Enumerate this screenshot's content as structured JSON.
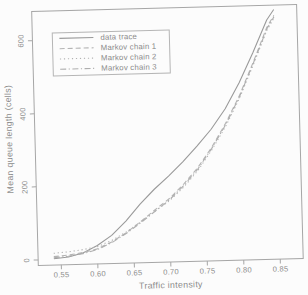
{
  "figure": {
    "background": "#fcfcfc",
    "axis_color": "#a6a6a6",
    "text_color": "#8c8c8c",
    "legend_border_color": "#b5b5b5"
  },
  "chart_data": {
    "type": "line",
    "title": "",
    "xlabel": "Traffic intensity",
    "ylabel": "Mean queue length (cells)",
    "xlim": [
      0.5185,
      0.8815
    ],
    "ylim": [
      -15,
      680
    ],
    "xticks": [
      0.55,
      0.6,
      0.65,
      0.7,
      0.75,
      0.8,
      0.85
    ],
    "xtick_labels": [
      "0.55",
      "0.60",
      "0.65",
      "0.70",
      "0.75",
      "0.80",
      "0.85"
    ],
    "yticks": [
      0,
      200,
      400,
      600
    ],
    "ytick_labels": [
      "0",
      "200",
      "400",
      "600"
    ],
    "grid": false,
    "legend_position": "top-left",
    "x": [
      0.54,
      0.56,
      0.58,
      0.6,
      0.62,
      0.64,
      0.66,
      0.68,
      0.7,
      0.72,
      0.74,
      0.76,
      0.78,
      0.8,
      0.82,
      0.84,
      0.85
    ],
    "series": [
      {
        "name": "data trace",
        "line_style": "solid",
        "color": "#9a9a9a",
        "values": [
          2,
          6,
          16,
          35,
          62,
          100,
          145,
          185,
          220,
          258,
          300,
          345,
          400,
          470,
          552,
          640,
          668
        ]
      },
      {
        "name": "Markov chain 1",
        "line_style": "dashed",
        "color": "#b4b4b4",
        "values": [
          8,
          11,
          17,
          26,
          44,
          68,
          97,
          128,
          158,
          196,
          240,
          295,
          360,
          435,
          525,
          620,
          652
        ]
      },
      {
        "name": "Markov chain 2",
        "line_style": "dotted",
        "color": "#b2b2b2",
        "values": [
          17,
          20,
          25,
          32,
          48,
          70,
          96,
          125,
          152,
          188,
          232,
          288,
          352,
          428,
          518,
          612,
          645
        ]
      },
      {
        "name": "Markov chain 3",
        "line_style": "dashdot",
        "color": "#aeaeae",
        "values": [
          5,
          8,
          14,
          24,
          42,
          66,
          94,
          124,
          154,
          192,
          236,
          292,
          356,
          432,
          522,
          616,
          648
        ]
      }
    ]
  }
}
